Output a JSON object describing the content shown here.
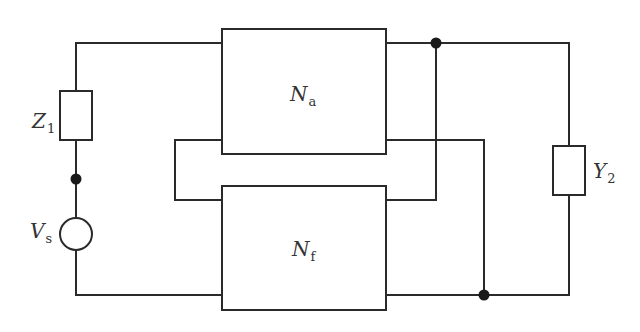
{
  "diagram": {
    "type": "circuit",
    "blocks": [
      {
        "id": "Na",
        "main": "N",
        "sub": "a"
      },
      {
        "id": "Nf",
        "main": "N",
        "sub": "f"
      }
    ],
    "components": [
      {
        "id": "Z1",
        "kind": "impedance",
        "main": "Z",
        "sub": "1"
      },
      {
        "id": "Vs",
        "kind": "voltage-source",
        "main": "V",
        "sub": "s"
      },
      {
        "id": "Y2",
        "kind": "admittance",
        "main": "Y",
        "sub": "2"
      }
    ],
    "junctions": 3
  }
}
